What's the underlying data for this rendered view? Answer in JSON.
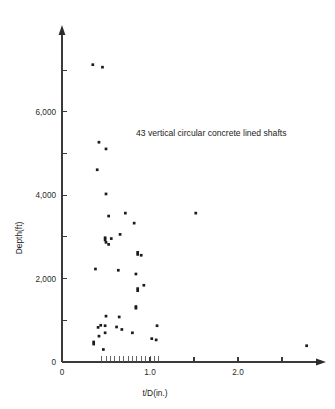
{
  "chart_data": {
    "type": "scatter",
    "title": "",
    "annotation": "43 vertical circular concrete lined shafts",
    "xlabel": "t/D(in.)",
    "ylabel": "Depth(ft)",
    "xlim": [
      0,
      2.95
    ],
    "ylim": [
      0,
      7400
    ],
    "grid": false,
    "legend": null,
    "x_ticks_major": [
      0,
      1.0,
      2.0
    ],
    "x_tick_labels": [
      "0",
      "1.0",
      "2.0"
    ],
    "x_ticks_unlabeled": [
      1.5,
      2.5
    ],
    "x_ticks_minor": [
      0.45,
      0.5,
      0.55,
      0.6,
      0.65,
      0.7,
      0.75,
      0.8,
      0.85,
      0.9,
      0.95,
      1.0,
      1.05,
      1.1
    ],
    "y_ticks_major": [
      0,
      2000,
      4000,
      6000
    ],
    "y_tick_labels": [
      "0",
      "2,000",
      "4,000",
      "6,000"
    ],
    "y_ticks_unlabeled": [
      1000,
      3000,
      5000,
      7000
    ],
    "n_points": 43,
    "series": [
      {
        "name": "shafts",
        "points": [
          [
            0.35,
            7130
          ],
          [
            0.46,
            7070
          ],
          [
            0.42,
            5270
          ],
          [
            0.5,
            5110
          ],
          [
            0.4,
            4610
          ],
          [
            0.5,
            4030
          ],
          [
            0.53,
            3500
          ],
          [
            0.72,
            3570
          ],
          [
            1.52,
            3570
          ],
          [
            0.82,
            3330
          ],
          [
            0.66,
            3060
          ],
          [
            0.49,
            2980
          ],
          [
            0.49,
            2930
          ],
          [
            0.56,
            2960
          ],
          [
            0.53,
            2820
          ],
          [
            0.5,
            2870
          ],
          [
            0.86,
            2630
          ],
          [
            0.86,
            2580
          ],
          [
            0.9,
            2560
          ],
          [
            0.38,
            2230
          ],
          [
            0.64,
            2200
          ],
          [
            0.84,
            2110
          ],
          [
            0.93,
            1840
          ],
          [
            0.86,
            1760
          ],
          [
            0.86,
            1710
          ],
          [
            0.84,
            1330
          ],
          [
            0.84,
            1290
          ],
          [
            0.5,
            1100
          ],
          [
            0.65,
            1080
          ],
          [
            0.44,
            880
          ],
          [
            0.49,
            870
          ],
          [
            0.62,
            840
          ],
          [
            0.41,
            830
          ],
          [
            1.08,
            870
          ],
          [
            0.68,
            780
          ],
          [
            0.49,
            700
          ],
          [
            0.8,
            700
          ],
          [
            0.42,
            620
          ],
          [
            1.02,
            560
          ],
          [
            1.07,
            530
          ],
          [
            0.36,
            480
          ],
          [
            0.36,
            430
          ],
          [
            0.47,
            300
          ],
          [
            2.78,
            390
          ]
        ]
      }
    ]
  },
  "axis": {
    "y_label": "Depth(ft)",
    "x_label": "t/D(in.)"
  },
  "annotation": {
    "text": "43 vertical circular concrete lined shafts"
  }
}
